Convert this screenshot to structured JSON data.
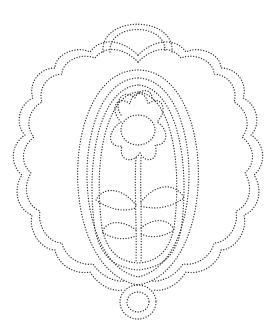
{
  "figure": {
    "stroke_color": "#333333",
    "background": "#ffffff",
    "caption": ""
  }
}
